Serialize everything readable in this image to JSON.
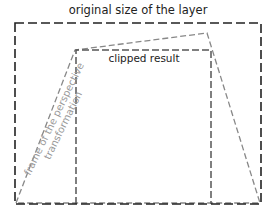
{
  "diagram": {
    "title": "original size of the layer",
    "clipped_label": "clipped result",
    "frame_label_line1": "frame of the perspective",
    "frame_label_line2": "transformation",
    "colors": {
      "outer_rect": "#222222",
      "clipped_rect": "#555555",
      "perspective_frame": "#888888",
      "frame_text": "#999999"
    },
    "shapes": {
      "outer_rect": {
        "x1": 15,
        "y1": 23,
        "x2": 261,
        "y2": 204
      },
      "clipped_rect": {
        "x1": 76,
        "y1": 50,
        "x2": 211,
        "y2": 204
      },
      "perspective_frame": [
        [
          16,
          203
        ],
        [
          75,
          50
        ],
        [
          207,
          33
        ],
        [
          260,
          203
        ]
      ]
    }
  }
}
